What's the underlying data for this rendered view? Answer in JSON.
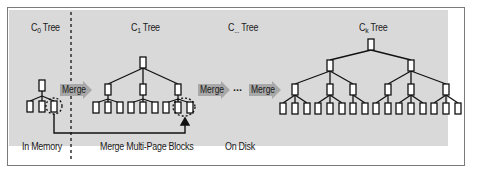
{
  "titles": {
    "c0": {
      "base": "C",
      "sub": "0",
      "suffix": " Tree"
    },
    "c1": {
      "base": "C",
      "sub": "1",
      "suffix": " Tree"
    },
    "cmid": {
      "base": "C",
      "sub": "...",
      "suffix": " Tree"
    },
    "ck": {
      "base": "C",
      "sub": "k",
      "suffix": " Tree"
    }
  },
  "bottom_labels": {
    "in_memory": "In Memory",
    "merge_blocks": "Merge Multi-Page Blocks",
    "on_disk": "On Disk"
  },
  "arrows": {
    "merge1": "Merge",
    "merge2": "Merge",
    "merge3": "Merge",
    "ellipsis": "..."
  },
  "colors": {
    "panel_bg": "#d9d9d9",
    "node_fill": "#ffffff",
    "line": "#111111",
    "arrow_fill": "#a8a8a8"
  },
  "trees": {
    "c0": {
      "levels": 2,
      "fanout": 3
    },
    "c1": {
      "levels": 3,
      "fanout": 3
    },
    "ck": {
      "levels": 4,
      "root_fanout": 2,
      "fanout": 3
    }
  }
}
